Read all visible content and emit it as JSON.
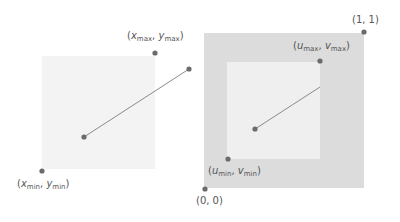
{
  "colors": {
    "left_square_fill": "#f3f3f3",
    "outer_square_fill": "#dcdcdc",
    "inner_square_fill": "#efefef",
    "point": "#6b6b6b",
    "line": "#8a8a8a",
    "text": "#555555"
  },
  "left_panel": {
    "square": {
      "x": 42,
      "y": 56,
      "w": 113,
      "h": 113
    },
    "points": [
      {
        "name": "min-corner",
        "cx": 42,
        "cy": 171
      },
      {
        "name": "max-corner",
        "cx": 155,
        "cy": 53
      },
      {
        "name": "segment-start",
        "cx": 84,
        "cy": 137
      },
      {
        "name": "segment-end",
        "cx": 189,
        "cy": 69
      }
    ],
    "labels": {
      "max": {
        "x_var": "x",
        "x_sub": "max",
        "y_var": "y",
        "y_sub": "max"
      },
      "min": {
        "x_var": "x",
        "x_sub": "min",
        "y_var": "y",
        "y_sub": "min"
      }
    }
  },
  "right_panel": {
    "outer_square": {
      "x": 204,
      "y": 33,
      "w": 160,
      "h": 155
    },
    "inner_square": {
      "x": 227,
      "y": 62,
      "w": 93,
      "h": 97
    },
    "points": [
      {
        "name": "origin",
        "cx": 205,
        "cy": 189
      },
      {
        "name": "one-one",
        "cx": 364,
        "cy": 32
      },
      {
        "name": "uv-min",
        "cx": 228,
        "cy": 159
      },
      {
        "name": "uv-max",
        "cx": 320,
        "cy": 61
      },
      {
        "name": "segment-start",
        "cx": 255,
        "cy": 129
      }
    ],
    "segment_end": {
      "x": 320,
      "y": 87
    },
    "labels": {
      "origin": "(0, 0)",
      "one_one": "(1, 1)",
      "max": {
        "u_var": "u",
        "u_sub": "max",
        "v_var": "v",
        "v_sub": "max"
      },
      "min": {
        "u_var": "u",
        "u_sub": "min",
        "v_var": "v",
        "v_sub": "min"
      }
    }
  }
}
